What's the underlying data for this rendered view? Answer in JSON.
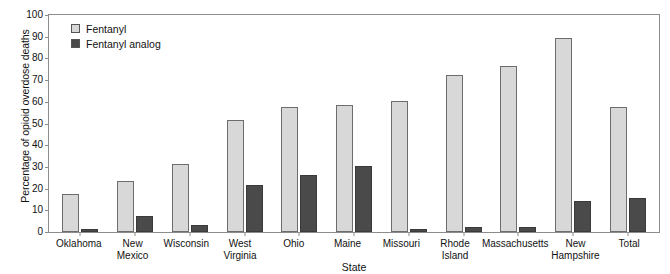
{
  "chart_data": {
    "type": "bar",
    "title": "",
    "xlabel": "State",
    "ylabel": "Percentage of opioid overdose deaths",
    "ylim": [
      0,
      100
    ],
    "yticks": [
      100,
      90,
      80,
      70,
      60,
      50,
      40,
      30,
      20,
      10,
      0
    ],
    "grid": false,
    "legend_position": "top-left",
    "categories": [
      "Oklahoma",
      "New Mexico",
      "Wisconsin",
      "West Virginia",
      "Ohio",
      "Maine",
      "Missouri",
      "Rhode Island",
      "Massachusetts",
      "New Hampshire",
      "Total"
    ],
    "series": [
      {
        "name": "Fentanyl",
        "color": "#d8d8d8",
        "values": [
          17,
          23,
          31,
          51,
          57,
          58,
          60,
          72,
          76,
          89,
          57
        ]
      },
      {
        "name": "Fentanyl analog",
        "color": "#4a4a4a",
        "values": [
          1,
          7,
          3,
          21,
          26,
          30,
          1,
          2,
          2,
          14,
          15
        ]
      }
    ]
  }
}
